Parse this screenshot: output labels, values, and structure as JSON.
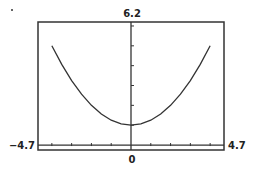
{
  "chart_data": {
    "type": "line",
    "title": "",
    "xlabel": "",
    "ylabel": "",
    "window": {
      "xmin": -4.7,
      "xmax": 4.7,
      "ymin": -0.25,
      "ymax": 6.2
    },
    "xlim": [
      -4.7,
      4.7
    ],
    "ylim": [
      -0.25,
      6.2
    ],
    "xscl": 1,
    "yscl": 1,
    "grid": false,
    "labels": {
      "xmin": "−4.7",
      "xmax": "4.7",
      "ymax": "6.2",
      "origin": "0"
    },
    "series": [
      {
        "name": "y = 1 + x^2/4",
        "domain": [
          -4,
          4
        ],
        "x": [
          -4,
          -3.5,
          -3,
          -2.5,
          -2,
          -1.5,
          -1,
          -0.5,
          0,
          0.5,
          1,
          1.5,
          2,
          2.5,
          3,
          3.5,
          4
        ],
        "y": [
          5,
          4.0625,
          3.25,
          2.5625,
          2,
          1.5625,
          1.25,
          1.0625,
          1,
          1.0625,
          1.25,
          1.5625,
          2,
          2.5625,
          3.25,
          4.0625,
          5
        ]
      }
    ],
    "colors": {
      "curve": "#333333",
      "axis": "#333333",
      "frame": "#333333"
    }
  }
}
